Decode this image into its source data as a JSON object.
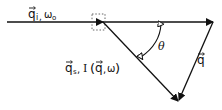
{
  "diagram": {
    "incident": {
      "vector": "q",
      "subscript": "i",
      "sep": ",",
      "freq": "ω",
      "freq_sub": "o"
    },
    "scattered": {
      "vector": "q",
      "subscript": "s",
      "sep": ",",
      "intensity": "I",
      "open": "(",
      "arg_vector": "q",
      "arg_sep": ",",
      "arg_freq": "ω",
      "close": ")"
    },
    "transfer": {
      "vector": "q"
    },
    "angle": {
      "symbol": "θ"
    },
    "colors": {
      "line": "#111111",
      "dotted_box": "#555555",
      "background": "#ffffff"
    }
  }
}
